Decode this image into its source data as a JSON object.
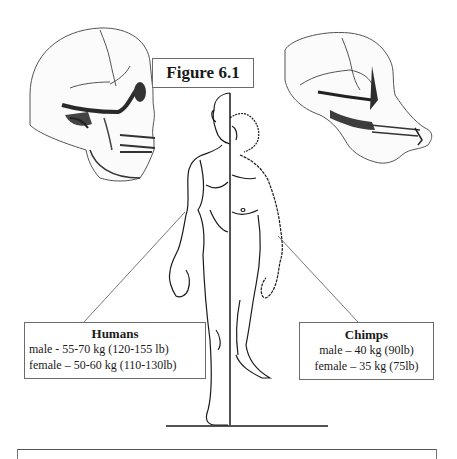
{
  "figure": {
    "title": "Figure 6.1"
  },
  "illustrations": {
    "left_skull": "human-skull",
    "right_skull": "chimpanzee-skull",
    "center_figure": "split-human-chimp-body"
  },
  "labels": {
    "humans": {
      "heading": "Humans",
      "male": "male - 55-70 kg (120-155 lb)",
      "female": "female – 50-60 kg (110-130lb)"
    },
    "chimps": {
      "heading": "Chimps",
      "male": "male – 40 kg (90lb)",
      "female": "female – 35 kg  (75lb)"
    }
  },
  "colors": {
    "ink": "#1a1a1a",
    "shade": "#3a3a3a",
    "box_border": "#6b6b6b",
    "background": "#ffffff"
  }
}
